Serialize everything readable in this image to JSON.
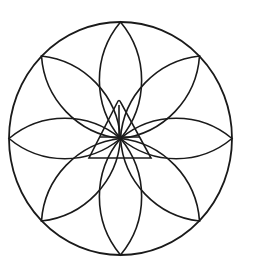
{
  "diagram": {
    "type": "geometric-rosette",
    "stroke_color": "#1a1a1a",
    "background": "#ffffff",
    "outer_circle": {
      "cx": 120.5,
      "cy": 138.5,
      "rx": 111.5,
      "ry": 116.5
    },
    "petal_count": 8,
    "petal_tips": [
      [
        120.5,
        22
      ],
      [
        199.5,
        56
      ],
      [
        232,
        138.5
      ],
      [
        199.5,
        221
      ],
      [
        120.5,
        255
      ],
      [
        41.5,
        221
      ],
      [
        9,
        138.5
      ],
      [
        41.5,
        56
      ]
    ],
    "center": [
      120.5,
      138.5
    ],
    "triangle": {
      "apex": [
        119,
        101
      ],
      "base_left": [
        89,
        158
      ],
      "base_right": [
        151,
        158
      ],
      "bar_y": 137,
      "bar_x1": 100,
      "bar_x2": 140
    }
  }
}
